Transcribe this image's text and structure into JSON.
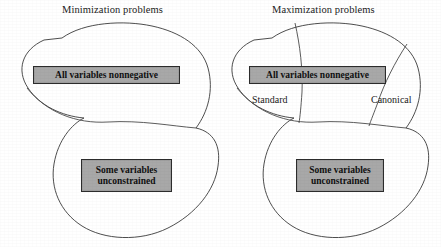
{
  "figure": {
    "type": "venn-blob-diagram",
    "background_color": "#ffffff",
    "outline_color": "#3a3a3a",
    "box_fill_color": "#a8a8a8",
    "box_border_color": "#2c2c2c"
  },
  "panels": [
    {
      "id": "minimization",
      "title": "Minimization problems",
      "boxes": [
        {
          "id": "min-all-nonnegative",
          "line1": "All variables nonnegative",
          "line2": ""
        },
        {
          "id": "min-some-unconstrained",
          "line1": "Some variables",
          "line2": "unconstrained"
        }
      ],
      "region_labels": []
    },
    {
      "id": "maximization",
      "title": "Maximization problems",
      "boxes": [
        {
          "id": "max-all-nonnegative",
          "line1": "All variables nonnegative",
          "line2": ""
        },
        {
          "id": "max-some-unconstrained",
          "line1": "Some variables",
          "line2": "unconstrained"
        }
      ],
      "region_labels": [
        {
          "id": "standard",
          "text": "Standard"
        },
        {
          "id": "canonical",
          "text": "Canonical"
        }
      ]
    }
  ]
}
